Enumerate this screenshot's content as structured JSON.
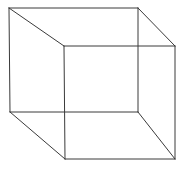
{
  "diagram": {
    "type": "wireframe-cube",
    "stroke_color": "#3a3a3a",
    "background": "#ffffff",
    "vertices": {
      "back_top_left": [
        9,
        8
      ],
      "back_top_right": [
        138,
        8
      ],
      "back_bottom_left": [
        10,
        112
      ],
      "back_bottom_right": [
        138,
        112
      ],
      "front_top_left": [
        64,
        46
      ],
      "front_top_right": [
        175,
        46
      ],
      "front_bottom_left": [
        65,
        159
      ],
      "front_bottom_right": [
        175,
        159
      ]
    }
  }
}
